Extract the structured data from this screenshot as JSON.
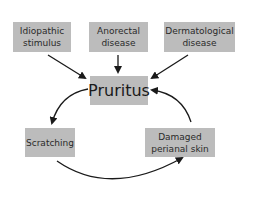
{
  "diagram": {
    "center": {
      "label": "Pruritus"
    },
    "causes": [
      {
        "label": "Idiopathic stimulus"
      },
      {
        "label": "Anorectal disease"
      },
      {
        "label": "Dermatological disease"
      }
    ],
    "cycle": [
      {
        "label": "Scratching"
      },
      {
        "label": "Damaged perianal skin"
      }
    ],
    "colors": {
      "box": "#bcbcbc",
      "arrow": "#1a1a1a",
      "background": "#ffffff"
    }
  }
}
